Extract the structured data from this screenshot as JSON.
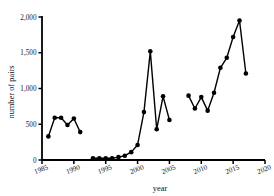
{
  "chart_data": {
    "type": "line",
    "title": "",
    "xlabel": "year",
    "ylabel": "number of pairs",
    "xlim": [
      1985,
      2020
    ],
    "ylim": [
      0,
      2000
    ],
    "xticks": [
      1985,
      1990,
      1995,
      2000,
      2005,
      2010,
      2015,
      2020
    ],
    "xtick_labels": [
      "1985",
      "1990",
      "1995",
      "2000",
      "2005",
      "2010",
      "2015",
      "2020"
    ],
    "yticks": [
      0,
      500,
      1000,
      1500,
      2000
    ],
    "ytick_labels": [
      "0",
      "500",
      "1,000",
      "1,500",
      "2,000"
    ],
    "grid": false,
    "legend": null,
    "marker": "filled-circle",
    "segments": [
      {
        "name": "1986-1991",
        "x": [
          1986,
          1987,
          1988,
          1989,
          1990,
          1991
        ],
        "y": [
          330,
          590,
          590,
          490,
          580,
          390
        ]
      },
      {
        "name": "1993-2005",
        "x": [
          1993,
          1994,
          1995,
          1996,
          1997,
          1998,
          1999,
          2000,
          2001,
          2002,
          2003,
          2004,
          2005
        ],
        "y": [
          25,
          25,
          25,
          25,
          40,
          60,
          110,
          210,
          670,
          1520,
          430,
          890,
          560
        ]
      },
      {
        "name": "2008-2017",
        "x": [
          2008,
          2009,
          2010,
          2011,
          2012,
          2013,
          2014,
          2015,
          2016,
          2017
        ],
        "y": [
          900,
          720,
          880,
          690,
          940,
          1290,
          1430,
          1720,
          1950,
          1210
        ]
      }
    ]
  },
  "axes": {
    "y_axis_title": "number of pairs",
    "x_axis_title": "year"
  }
}
